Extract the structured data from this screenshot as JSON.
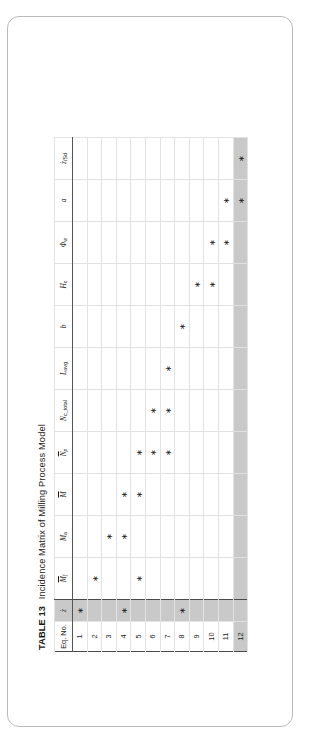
{
  "document": {
    "table_label": "TABLE 13",
    "title": "Incidence Matrix of Milling Process Model",
    "full_title": "TABLE 13  Incidence Matrix of Milling Process Model"
  },
  "table": {
    "corner_header": "Eq. No.",
    "columns": [
      {
        "key": "zdot",
        "label": "ż",
        "shaded": true
      },
      {
        "key": "Mf",
        "label": "M̲f",
        "shaded": false
      },
      {
        "key": "Ma",
        "label": "Mₐ",
        "shaded": false
      },
      {
        "key": "M",
        "label": "M̲",
        "shaded": false
      },
      {
        "key": "Np",
        "label": "N̲p",
        "shaded": false
      },
      {
        "key": "Nc_total",
        "label": "N_c_total",
        "shaded": false
      },
      {
        "key": "Lavg",
        "label": "Lₐᵥᵍ",
        "shaded": false
      },
      {
        "key": "b",
        "label": "b",
        "shaded": false
      },
      {
        "key": "Hc",
        "label": "Hс",
        "shaded": false
      },
      {
        "key": "phiw",
        "label": "Φᵥᵥ",
        "shaded": false
      },
      {
        "key": "a",
        "label": "a",
        "shaded": false
      },
      {
        "key": "zdot_Sd",
        "label": "ż/Sd",
        "shaded": false
      }
    ],
    "column_headers_plain": [
      "ż",
      "Mf",
      "Ma",
      "M",
      "Np",
      "Nc_total",
      "Lavg",
      "b",
      "Hc",
      "Φw",
      "a",
      "ż/Sd"
    ],
    "rows": [
      {
        "eq": "1",
        "shaded": false,
        "marks": [
          "zdot"
        ]
      },
      {
        "eq": "2",
        "shaded": false,
        "marks": [
          "Mf"
        ]
      },
      {
        "eq": "3",
        "shaded": false,
        "marks": [
          "Ma"
        ]
      },
      {
        "eq": "4",
        "shaded": false,
        "marks": [
          "zdot",
          "Ma",
          "M"
        ]
      },
      {
        "eq": "5",
        "shaded": false,
        "marks": [
          "Mf",
          "M",
          "Np"
        ]
      },
      {
        "eq": "6",
        "shaded": false,
        "marks": [
          "Np",
          "Nc_total"
        ]
      },
      {
        "eq": "7",
        "shaded": false,
        "marks": [
          "Np",
          "Nc_total",
          "Lavg"
        ]
      },
      {
        "eq": "8",
        "shaded": false,
        "marks": [
          "zdot",
          "b"
        ]
      },
      {
        "eq": "9",
        "shaded": false,
        "marks": [
          "Hc"
        ]
      },
      {
        "eq": "10",
        "shaded": false,
        "marks": [
          "Hc",
          "phiw"
        ]
      },
      {
        "eq": "11",
        "shaded": false,
        "marks": [
          "phiw",
          "a"
        ]
      },
      {
        "eq": "12",
        "shaded": true,
        "marks": [
          "a",
          "zdot_Sd"
        ]
      }
    ],
    "mark_glyph": "∗",
    "row_count": 12,
    "column_count": 12
  },
  "style": {
    "shade_color": "#c9c9c9",
    "grid_color": "#e2e2e2",
    "frame_color": "#4a4a4a",
    "text_color": "#1c1c1c",
    "page_background": "#ffffff",
    "card_border": "#b9b9b9"
  }
}
